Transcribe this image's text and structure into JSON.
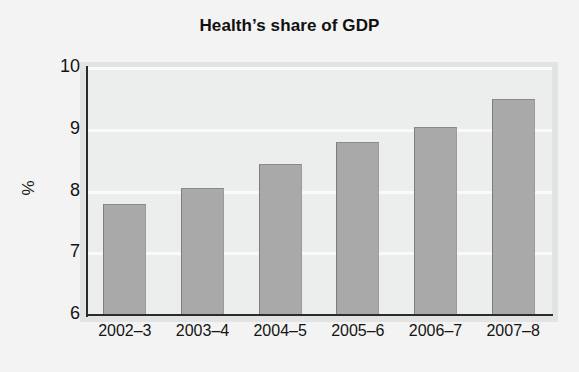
{
  "chart_data": {
    "type": "bar",
    "title": "Health’s share of GDP",
    "xlabel": "",
    "ylabel": "%",
    "categories": [
      "2002–3",
      "2003–4",
      "2004–5",
      "2005–6",
      "2006–7",
      "2007–8"
    ],
    "values": [
      7.8,
      8.05,
      8.45,
      8.8,
      9.05,
      9.5
    ],
    "ylim": [
      6,
      10
    ],
    "yticks": [
      6,
      7,
      8,
      9,
      10
    ],
    "ytick_labels": [
      "6",
      "7",
      "8",
      "9",
      "10"
    ],
    "grid": true,
    "grid_axis": "y",
    "legend": null,
    "bar_color": "#a9a9a9",
    "plot_background": "#eceded",
    "figure_background": "#f3f3f3",
    "axis_color": "#2b2b2b",
    "gridline_color": "#fafafa",
    "text_color": "#141414"
  }
}
